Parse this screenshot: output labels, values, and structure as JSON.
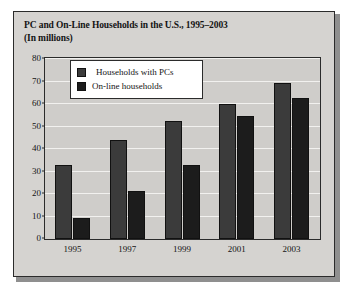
{
  "figure": {
    "title_line1": "PC and On-Line Households in the U.S., 1995–2003",
    "title_line2": "(In millions)"
  },
  "colors": {
    "panel_background": "#d5d3d0",
    "plot_background": "#cfcdca",
    "frame": "#2b2b2b",
    "gridline": "#f2f1ef",
    "series_pc": "#3b3b3b",
    "series_online": "#1c1c1c",
    "legend_background": "#ffffff"
  },
  "chart_data": {
    "type": "bar",
    "title": "PC and On-Line Households in the U.S., 1995–2003",
    "subtitle": "(In millions)",
    "xlabel": "",
    "ylabel": "",
    "categories": [
      "1995",
      "1997",
      "1999",
      "2001",
      "2003"
    ],
    "series": [
      {
        "name": "Households with PCs",
        "values": [
          33,
          44,
          52.5,
          60,
          69.5
        ]
      },
      {
        "name": "On-line households",
        "values": [
          9.5,
          21.5,
          33,
          54.5,
          62.5
        ]
      }
    ],
    "ylim": [
      0,
      80
    ],
    "yticks": [
      0,
      10,
      20,
      30,
      40,
      50,
      60,
      70,
      80
    ],
    "ytick_labels": [
      "0",
      "10",
      "20",
      "30",
      "40",
      "50",
      "60",
      "70",
      "80"
    ],
    "grid": true,
    "legend_position": "upper-left-inside"
  },
  "legend": {
    "items": [
      {
        "label": "Households with PCs"
      },
      {
        "label": "On-line households"
      }
    ]
  }
}
